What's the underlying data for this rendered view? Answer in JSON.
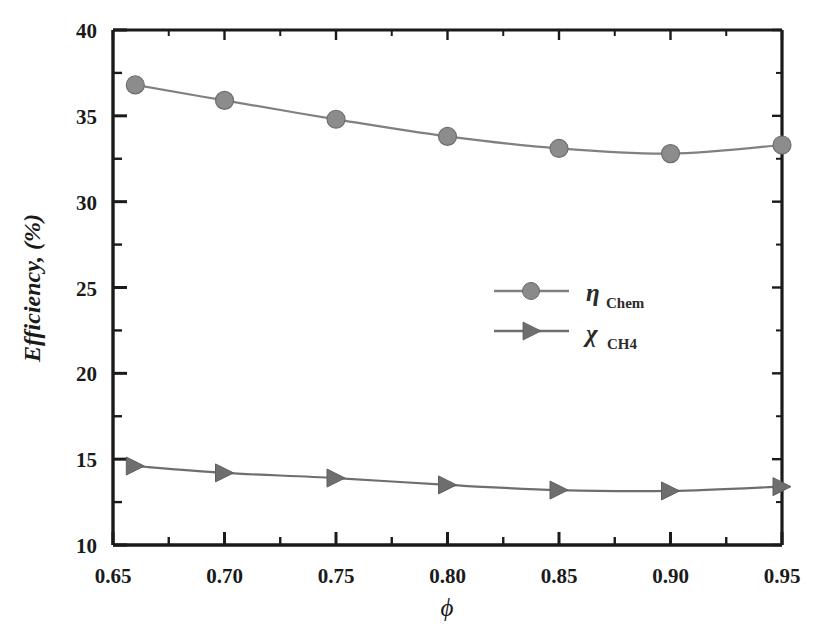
{
  "chart_data": {
    "type": "line",
    "title": "",
    "xlabel": "ϕ",
    "ylabel": "Efficiency, (%)",
    "xlim": [
      0.65,
      0.95
    ],
    "ylim": [
      10,
      40
    ],
    "grid": false,
    "legend_position": "center-right",
    "x_ticks": [
      "0.65",
      "0.70",
      "0.75",
      "0.80",
      "0.85",
      "0.90",
      "0.95"
    ],
    "x_tick_values": [
      0.65,
      0.7,
      0.75,
      0.8,
      0.85,
      0.9,
      0.95
    ],
    "x_minor_tick_values": [
      0.675,
      0.725,
      0.775,
      0.825,
      0.875,
      0.925
    ],
    "y_ticks": [
      "10",
      "15",
      "20",
      "25",
      "30",
      "35",
      "40"
    ],
    "y_tick_values": [
      10,
      15,
      20,
      25,
      30,
      35,
      40
    ],
    "y_minor_tick_values": [
      12.5,
      17.5,
      22.5,
      27.5,
      32.5,
      37.5
    ],
    "x": [
      0.66,
      0.7,
      0.75,
      0.8,
      0.85,
      0.9,
      0.95
    ],
    "series": [
      {
        "name": "η",
        "subscript": "Chem",
        "marker": "circle",
        "color": "#808080",
        "values": [
          36.8,
          35.9,
          34.8,
          33.8,
          33.1,
          32.8,
          33.3
        ]
      },
      {
        "name": "χ",
        "subscript": "CH4",
        "marker": "triangle-right",
        "color": "#6e6e6e",
        "values": [
          14.6,
          14.2,
          13.9,
          13.5,
          13.2,
          13.15,
          13.4
        ]
      }
    ]
  },
  "legend": {
    "entries": [
      {
        "symbol": "η",
        "subscript": "Chem"
      },
      {
        "symbol": "χ",
        "subscript": "CH4"
      }
    ]
  },
  "axes": {
    "y_title": "Efficiency, (%)",
    "x_title": "ϕ"
  }
}
